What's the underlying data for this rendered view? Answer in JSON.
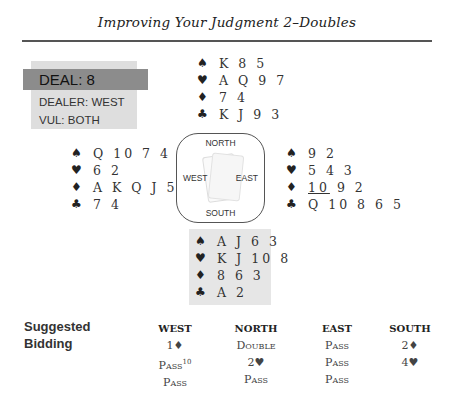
{
  "header": {
    "title": "Improving Your Judgment 2–Doubles"
  },
  "deal": {
    "label": "DEAL: 8",
    "dealer": "DEALER: WEST",
    "vul": "VUL: BOTH"
  },
  "suits": {
    "spades": "♠",
    "hearts": "♥",
    "diamonds": "♦",
    "clubs": "♣"
  },
  "hands": {
    "north": {
      "spades": "K 8 5",
      "hearts": "A Q 9 7",
      "diamonds": "7 4",
      "clubs": "K J 9 3"
    },
    "west": {
      "spades": "Q 10 7 4",
      "hearts": "6 2",
      "diamonds": "A K Q J 5",
      "clubs": "7 4"
    },
    "east": {
      "spades": "9 2",
      "hearts": "5 4 3",
      "diamonds_underlined": "10",
      "diamonds_rest": " 9 2",
      "clubs": "Q 10 8 6 5"
    },
    "south": {
      "spades": "A J 6 3",
      "hearts": "K J 10 8",
      "diamonds": "8 6 3",
      "clubs": "A 2"
    }
  },
  "compass": {
    "north": "NORTH",
    "south": "SOUTH",
    "east": "EAST",
    "west": "WEST"
  },
  "bidding": {
    "label_line1": "Suggested",
    "label_line2": "Bidding",
    "columns": [
      {
        "header": "WEST",
        "bids": [
          "1♦",
          "Pass",
          "Pass"
        ],
        "footnote": "10"
      },
      {
        "header": "NORTH",
        "bids": [
          "Double",
          "2♥",
          "Pass"
        ]
      },
      {
        "header": "EAST",
        "bids": [
          "Pass",
          "Pass",
          "Pass"
        ]
      },
      {
        "header": "SOUTH",
        "bids": [
          "2♦",
          "4♥"
        ]
      }
    ]
  }
}
